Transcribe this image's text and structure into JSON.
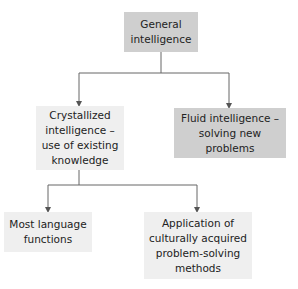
{
  "diagram": {
    "type": "tree",
    "nodes": {
      "root": {
        "label": "General\nintelligence",
        "fill": "#cfcfcf"
      },
      "crystallized": {
        "label": "Crystallized\nintelligence –\nuse of existing\nknowledge",
        "fill": "#efefef"
      },
      "fluid": {
        "label": "Fluid intelligence –\nsolving new\nproblems",
        "fill": "#cfcfcf"
      },
      "language": {
        "label": "Most language\nfunctions",
        "fill": "#efefef"
      },
      "application": {
        "label": "Application of\nculturally acquired\nproblem-solving\nmethods",
        "fill": "#efefef"
      }
    },
    "edges": [
      {
        "from": "root",
        "to": "crystallized"
      },
      {
        "from": "root",
        "to": "fluid"
      },
      {
        "from": "crystallized",
        "to": "language"
      },
      {
        "from": "crystallized",
        "to": "application"
      }
    ]
  }
}
